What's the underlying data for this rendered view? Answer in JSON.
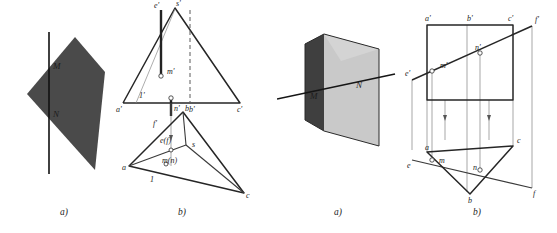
{
  "page": {
    "width": 557,
    "height": 233,
    "background": "#ffffff",
    "ink": "#262626"
  },
  "figure_left": {
    "caption_a": "a)",
    "caption_b": "b)",
    "pictorial": {
      "name": "tetrahedron-silhouette",
      "fill": "#4a4a4a",
      "polygon": [
        [
          27,
          94
        ],
        [
          75,
          37
        ],
        [
          105,
          72
        ],
        [
          95,
          170
        ],
        [
          27,
          94
        ]
      ],
      "line": {
        "x": 49,
        "y1": 32,
        "y2": 174
      },
      "labels": [
        {
          "text": "M",
          "x": 53,
          "y": 69
        },
        {
          "text": "N",
          "x": 53,
          "y": 117
        }
      ]
    },
    "projection": {
      "front_view": {
        "triangle": [
          [
            123,
            103
          ],
          [
            175,
            8
          ],
          [
            240,
            103
          ]
        ],
        "labels": [
          {
            "text": "s'",
            "x": 176,
            "y": 6
          },
          {
            "text": "a'",
            "x": 116,
            "y": 112
          },
          {
            "text": "b'",
            "x": 189,
            "y": 112
          },
          {
            "text": "c'",
            "x": 237,
            "y": 112
          },
          {
            "text": "e'",
            "x": 154,
            "y": 8
          },
          {
            "text": "m'",
            "x": 167,
            "y": 74
          },
          {
            "text": "n'",
            "x": 174,
            "y": 111
          },
          {
            "text": "1'",
            "x": 139,
            "y": 98
          }
        ],
        "trace_line": {
          "x": 161,
          "y1": 10,
          "y2": 76
        },
        "trace_line2": {
          "x": 171,
          "y1": 98,
          "y2": 116
        },
        "dashed_altitude": {
          "x": 190,
          "y1": 10,
          "y2": 103
        },
        "ray_s_to_1": [
          [
            175,
            9
          ],
          [
            136,
            103
          ]
        ],
        "markers": [
          {
            "x": 161,
            "y": 76
          },
          {
            "x": 171,
            "y": 98
          }
        ]
      },
      "top_view": {
        "triangle": [
          [
            129,
            166
          ],
          [
            183,
            112
          ],
          [
            244,
            193
          ]
        ],
        "inner_point_s": [
          186,
          145
        ],
        "labels": [
          {
            "text": "a",
            "x": 122,
            "y": 170
          },
          {
            "text": "b",
            "x": 185,
            "y": 111
          },
          {
            "text": "c",
            "x": 246,
            "y": 198
          },
          {
            "text": "s",
            "x": 192,
            "y": 147
          },
          {
            "text": "e(f)",
            "x": 160,
            "y": 143
          },
          {
            "text": "m(n)",
            "x": 162,
            "y": 163
          },
          {
            "text": "1",
            "x": 150,
            "y": 182
          },
          {
            "text": "f'",
            "x": 153,
            "y": 126
          }
        ],
        "markers": [
          {
            "x": 171,
            "y": 150
          },
          {
            "x": 166,
            "y": 164
          }
        ]
      },
      "projector": {
        "x": 171,
        "y1": 103,
        "y2": 166,
        "arrow_y": 140
      }
    }
  },
  "figure_right": {
    "caption_a": "a)",
    "caption_b": "b)",
    "pictorial": {
      "name": "triangular-prism",
      "faces": {
        "left_dark": {
          "fill": "#3f3f3f",
          "polygon": [
            [
              28,
              44
            ],
            [
              47,
              34
            ],
            [
              47,
              131
            ],
            [
              28,
              120
            ]
          ]
        },
        "front_light": {
          "fill": "#c9c9c9",
          "polygon": [
            [
              47,
              34
            ],
            [
              102,
              49
            ],
            [
              102,
              146
            ],
            [
              47,
              131
            ]
          ]
        },
        "top_light": {
          "fill": "#b5b5b5",
          "polygon": [
            [
              28,
              44
            ],
            [
              47,
              34
            ],
            [
              102,
              49
            ],
            [
              64,
              61
            ]
          ]
        },
        "top_right": {
          "fill": "#d4d4d4",
          "polygon": [
            [
              47,
              34
            ],
            [
              102,
              49
            ],
            [
              64,
              61
            ]
          ]
        }
      },
      "piercing_line": [
        [
          0,
          99
        ],
        [
          118,
          74
        ]
      ],
      "labels": [
        {
          "text": "M",
          "x": 33,
          "y": 99
        },
        {
          "text": "N",
          "x": 79,
          "y": 88
        }
      ]
    },
    "projection": {
      "front_view": {
        "rect": {
          "x": 150,
          "y": 25,
          "w": 86,
          "h": 75
        },
        "labels": [
          {
            "text": "a'",
            "x": 148,
            "y": 21
          },
          {
            "text": "b'",
            "x": 190,
            "y": 21
          },
          {
            "text": "c'",
            "x": 231,
            "y": 21
          },
          {
            "text": "e'",
            "x": 128,
            "y": 76
          },
          {
            "text": "m'",
            "x": 163,
            "y": 68
          },
          {
            "text": "n'",
            "x": 198,
            "y": 50
          },
          {
            "text": "f'",
            "x": 258,
            "y": 22
          }
        ],
        "line_ef": [
          [
            135,
            80
          ],
          [
            255,
            26
          ]
        ],
        "markers": [
          {
            "x": 155,
            "y": 71
          },
          {
            "x": 203,
            "y": 53
          }
        ],
        "verticals": [
          {
            "x": 135,
            "y1": 80,
            "y2": 150
          },
          {
            "x": 155,
            "y1": 71,
            "y2": 156
          },
          {
            "x": 190,
            "y1": 25,
            "y2": 192
          },
          {
            "x": 203,
            "y1": 53,
            "y2": 170
          },
          {
            "x": 255,
            "y1": 26,
            "y2": 188
          },
          {
            "x": 150,
            "y1": 100,
            "y2": 152
          },
          {
            "x": 236,
            "y1": 100,
            "y2": 146
          }
        ],
        "arrow_verticals": [
          {
            "x": 168,
            "y": 120
          },
          {
            "x": 212,
            "y": 120
          }
        ]
      },
      "top_view": {
        "triangle": [
          [
            150,
            152
          ],
          [
            193,
            194
          ],
          [
            236,
            146
          ]
        ],
        "line_ef": [
          [
            135,
            160
          ],
          [
            255,
            188
          ]
        ],
        "labels": [
          {
            "text": "a",
            "x": 148,
            "y": 150
          },
          {
            "text": "b",
            "x": 191,
            "y": 203
          },
          {
            "text": "c",
            "x": 240,
            "y": 143
          },
          {
            "text": "e",
            "x": 130,
            "y": 168
          },
          {
            "text": "m",
            "x": 162,
            "y": 163
          },
          {
            "text": "n",
            "x": 196,
            "y": 170
          },
          {
            "text": "f",
            "x": 256,
            "y": 196
          }
        ],
        "markers": [
          {
            "x": 155,
            "y": 160
          },
          {
            "x": 203,
            "y": 170
          }
        ]
      }
    }
  }
}
